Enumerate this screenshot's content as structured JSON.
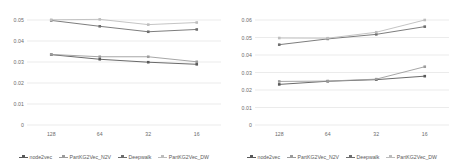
{
  "figure": {
    "panels": [
      {
        "name": "left-chart",
        "axis": {
          "ylabels": [
            "0.05",
            "0.04",
            "0.03",
            "0.02",
            "0.01",
            "0"
          ],
          "xlabels": [
            "128",
            "64",
            "32",
            "16"
          ]
        }
      },
      {
        "name": "right-chart",
        "axis": {
          "ylabels": [
            "0.06",
            "0.05",
            "0.04",
            "0.03",
            "0.02",
            "0.01",
            "0"
          ],
          "xlabels": [
            "128",
            "64",
            "32",
            "16"
          ]
        }
      }
    ],
    "legend": {
      "items": [
        {
          "label": "node2vec",
          "color": "#595959",
          "marker": "square"
        },
        {
          "label": "PartKG2Vec_N2V",
          "color": "#9c9c9c",
          "marker": "square"
        },
        {
          "label": "Deepwalk",
          "color": "#6e6e6e",
          "marker": "square"
        },
        {
          "label": "PartKG2Vec_DW",
          "color": "#bdbdbd",
          "marker": "square"
        }
      ]
    }
  },
  "chart_data": [
    {
      "type": "line",
      "name": "left-chart",
      "title": "",
      "xlabel": "",
      "ylabel": "",
      "categories": [
        "128",
        "64",
        "32",
        "16"
      ],
      "ylim": [
        0,
        0.05
      ],
      "yticks": [
        0,
        0.01,
        0.02,
        0.03,
        0.04,
        0.05
      ],
      "grid": true,
      "legend_position": "bottom",
      "series": [
        {
          "name": "node2vec",
          "color": "#595959",
          "values": [
            0.0335,
            0.0313,
            0.0299,
            0.0289
          ]
        },
        {
          "name": "PartKG2Vec_N2V",
          "color": "#9c9c9c",
          "values": [
            0.0336,
            0.0325,
            0.0325,
            0.0301
          ]
        },
        {
          "name": "Deepwalk",
          "color": "#6e6e6e",
          "values": [
            0.0498,
            0.047,
            0.0444,
            0.0455
          ]
        },
        {
          "name": "PartKG2Vec_DW",
          "color": "#bdbdbd",
          "values": [
            0.0501,
            0.0503,
            0.0478,
            0.0488
          ]
        }
      ]
    },
    {
      "type": "line",
      "name": "right-chart",
      "title": "",
      "xlabel": "",
      "ylabel": "",
      "categories": [
        "128",
        "64",
        "32",
        "16"
      ],
      "ylim": [
        0,
        0.06
      ],
      "yticks": [
        0,
        0.01,
        0.02,
        0.03,
        0.04,
        0.05,
        0.06
      ],
      "grid": true,
      "legend_position": "bottom",
      "series": [
        {
          "name": "node2vec",
          "color": "#595959",
          "values": [
            0.0232,
            0.025,
            0.0259,
            0.0279
          ]
        },
        {
          "name": "PartKG2Vec_N2V",
          "color": "#9c9c9c",
          "values": [
            0.0249,
            0.0251,
            0.0262,
            0.0333
          ]
        },
        {
          "name": "Deepwalk",
          "color": "#6e6e6e",
          "values": [
            0.0459,
            0.0492,
            0.0518,
            0.0562
          ]
        },
        {
          "name": "PartKG2Vec_DW",
          "color": "#bdbdbd",
          "values": [
            0.0497,
            0.0496,
            0.053,
            0.06
          ]
        }
      ]
    }
  ]
}
